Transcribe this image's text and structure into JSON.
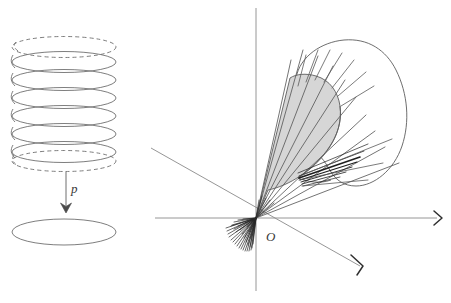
{
  "figure": {
    "background_color": "#ffffff",
    "width": 451,
    "height": 303,
    "stroke_color": "#6b6b6b",
    "dark_stroke_color": "#2a2a2a",
    "shade_color": "#d6d6d6"
  },
  "left_panel": {
    "name": "helix-projection",
    "helix": {
      "center_x": 64,
      "ellipse_rx": 52,
      "ellipse_ry": 11,
      "solid_turns": 6,
      "solid_turn_y": [
        62,
        80,
        98,
        116,
        134,
        152
      ],
      "dashed_turn_y": [
        47,
        160
      ],
      "dashed_pattern": "4 3"
    },
    "arrow": {
      "name": "projection-arrow",
      "label": "p",
      "x": 66,
      "y_start": 172,
      "y_end": 212
    },
    "image_ellipse": {
      "name": "projected-circle",
      "cx": 64,
      "cy": 232,
      "rx": 52,
      "ry": 13
    }
  },
  "right_panel": {
    "name": "cone-fan-diagram",
    "origin": {
      "x": 256,
      "y": 218,
      "label": "O",
      "label_x": 266,
      "label_y": 240
    },
    "axes": [
      {
        "name": "axis-vertical",
        "x1": 256,
        "y1": 8,
        "x2": 256,
        "y2": 291,
        "arrow": "none"
      },
      {
        "name": "axis-horizontal",
        "x1": 155,
        "y1": 218,
        "x2": 440,
        "y2": 218,
        "arrow": "end"
      },
      {
        "name": "axis-diagonal",
        "x1": 151,
        "y1": 148,
        "x2": 364,
        "y2": 269,
        "arrow": "end"
      }
    ],
    "rays": {
      "name": "ray-fan",
      "count_main": 9,
      "angles_deg": [
        21,
        29,
        36,
        43,
        50,
        57,
        63,
        69,
        74
      ],
      "dense_cluster_angles_deg": [
        198,
        203,
        208,
        213,
        218,
        223,
        228,
        232,
        236,
        240,
        244,
        248,
        252,
        256,
        260
      ]
    },
    "shaded_region": {
      "name": "shaded-cone",
      "fill": "#d6d6d6",
      "description": "solid gray cone from origin bounded by a curved arc"
    },
    "outline_region": {
      "name": "blob-outline",
      "fill": "#ffffff",
      "description": "white curved blob outline enclosing the upper fan rays"
    }
  },
  "labels": {
    "p": "p",
    "O": "O"
  }
}
